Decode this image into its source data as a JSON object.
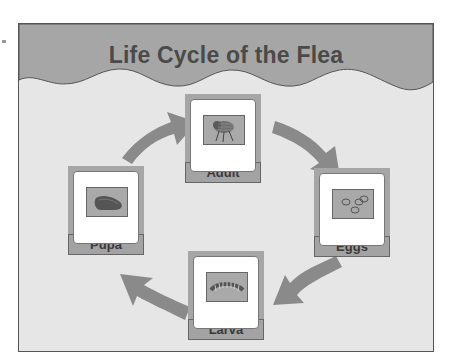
{
  "title": "Life Cycle of the Flea",
  "stages": [
    {
      "name": "Adult",
      "icon": "flea-icon"
    },
    {
      "name": "Eggs",
      "icon": "eggs-icon"
    },
    {
      "name": "Larva",
      "icon": "larva-icon"
    },
    {
      "name": "Pupa",
      "icon": "pupa-icon"
    }
  ],
  "colors": {
    "banner": "#a6a6a6",
    "background": "#e6e6e6",
    "arrow": "#8a8a8a",
    "text": "#4a4a4a"
  }
}
